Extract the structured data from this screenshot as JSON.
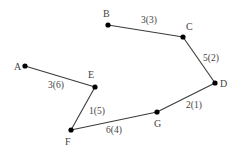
{
  "diagram": {
    "type": "weighted-graph-path",
    "nodes": [
      {
        "id": "A",
        "label": "A",
        "x": 25,
        "y": 66,
        "lx": 14,
        "ly": 70
      },
      {
        "id": "B",
        "label": "B",
        "x": 108,
        "y": 25,
        "lx": 103,
        "ly": 17
      },
      {
        "id": "C",
        "label": "C",
        "x": 183,
        "y": 37,
        "lx": 186,
        "ly": 30
      },
      {
        "id": "D",
        "label": "D",
        "x": 215,
        "y": 83,
        "lx": 220,
        "ly": 87
      },
      {
        "id": "E",
        "label": "E",
        "x": 95,
        "y": 87,
        "lx": 88,
        "ly": 78
      },
      {
        "id": "F",
        "label": "F",
        "x": 71,
        "y": 130,
        "lx": 65,
        "ly": 145
      },
      {
        "id": "G",
        "label": "G",
        "x": 157,
        "y": 112,
        "lx": 154,
        "ly": 127
      }
    ],
    "edges": [
      {
        "from": "A",
        "to": "E",
        "label": "3(6)",
        "lx": 48,
        "ly": 88
      },
      {
        "from": "E",
        "to": "F",
        "label": "1(5)",
        "lx": 89,
        "ly": 114
      },
      {
        "from": "F",
        "to": "G",
        "label": "6(4)",
        "lx": 106,
        "ly": 133
      },
      {
        "from": "G",
        "to": "D",
        "label": "2(1)",
        "lx": 186,
        "ly": 108
      },
      {
        "from": "D",
        "to": "C",
        "label": "5(2)",
        "lx": 203,
        "ly": 61
      },
      {
        "from": "C",
        "to": "B",
        "label": "3(3)",
        "lx": 141,
        "ly": 23
      }
    ]
  }
}
